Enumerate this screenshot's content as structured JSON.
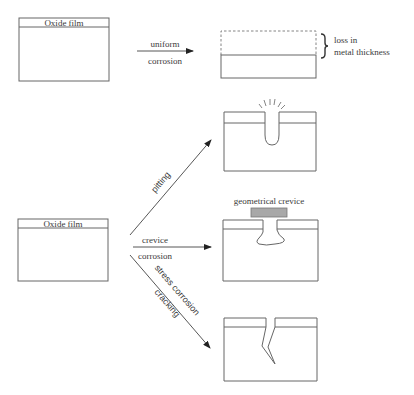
{
  "diagram": {
    "type": "corrosion-forms-schematic",
    "start_boxes": [
      {
        "label": "Oxide film"
      },
      {
        "label": "Oxide film"
      }
    ],
    "arrows": {
      "uniform": {
        "line1": "uniform",
        "line2": "corrosion"
      },
      "pitting": {
        "label": "pitting"
      },
      "crevice": {
        "line1": "crevice",
        "line2": "corrosion"
      },
      "scc": {
        "line1": "stress corrosion",
        "line2": "cracking"
      }
    },
    "results": {
      "uniform": {
        "annotation_line1": "loss in",
        "annotation_line2": "metal thickness"
      },
      "crevice": {
        "label": "geometrical crevice"
      }
    },
    "colors": {
      "stroke": "#555555",
      "text": "#3a3a3a",
      "crevice_shim": "#a8a8a8"
    }
  }
}
